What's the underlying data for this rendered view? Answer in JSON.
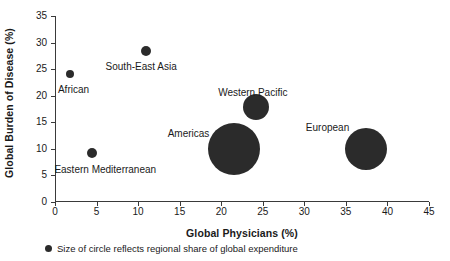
{
  "chart_data": {
    "type": "scatter",
    "title": "",
    "xlabel": "Global Physicians (%)",
    "ylabel": "Global Burden of Disease (%)",
    "xlim": [
      0,
      45
    ],
    "ylim": [
      0,
      35
    ],
    "xticks": [
      0,
      5,
      10,
      15,
      20,
      25,
      30,
      35,
      40,
      45
    ],
    "yticks": [
      0,
      5,
      10,
      15,
      20,
      25,
      30,
      35
    ],
    "grid": false,
    "legend_position": "below-axis",
    "annotation": "Size of circle reflects regional share of global expenditure",
    "size_note": "Size of circle reflects regional share of global expenditure",
    "bubble_color": "#2b2b2b",
    "points": [
      {
        "label": "African",
        "x": 1.8,
        "y": 24.1,
        "radius_px": 4,
        "label_dx": -12,
        "label_dy": 10
      },
      {
        "label": "South-East Asia",
        "x": 10.9,
        "y": 28.4,
        "radius_px": 5,
        "label_dx": -40,
        "label_dy": 10
      },
      {
        "label": "Eastern Mediterranean",
        "x": 4.5,
        "y": 9.2,
        "radius_px": 5,
        "label_dx": -38,
        "label_dy": 11
      },
      {
        "label": "Western Pacific",
        "x": 24.2,
        "y": 17.8,
        "radius_px": 13,
        "label_dx": -38,
        "label_dy": -20
      },
      {
        "label": "Americas",
        "x": 21.5,
        "y": 10.0,
        "radius_px": 26,
        "label_dx": -66,
        "label_dy": -21
      },
      {
        "label": "European",
        "x": 37.4,
        "y": 10.0,
        "radius_px": 21,
        "label_dx": -60,
        "label_dy": -27
      }
    ]
  },
  "axes": {
    "x_label": "Global Physicians (%)",
    "y_label": "Global Burden of Disease (%)",
    "x_tick_labels": [
      "0",
      "5",
      "10",
      "15",
      "20",
      "25",
      "30",
      "35",
      "40",
      "45"
    ],
    "y_tick_labels": [
      "0",
      "5",
      "10",
      "15",
      "20",
      "25",
      "30",
      "35"
    ]
  },
  "footnote": {
    "text": "Size of circle reflects regional share of global expenditure"
  }
}
